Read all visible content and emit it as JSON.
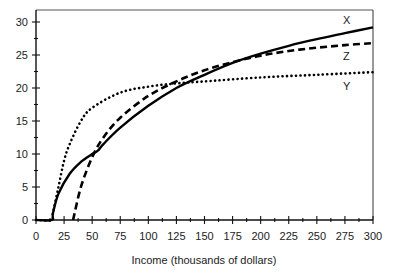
{
  "chart_data": {
    "type": "line",
    "title": "",
    "xlabel": "Income (thousands of dollars)",
    "ylabel": "",
    "xlim": [
      0,
      300
    ],
    "ylim": [
      0,
      30
    ],
    "x_ticks": [
      0,
      25,
      50,
      75,
      100,
      125,
      150,
      175,
      200,
      225,
      250,
      275,
      300
    ],
    "y_ticks": [
      0,
      5,
      10,
      15,
      20,
      25,
      30
    ],
    "grid": false,
    "legend": "inline labels at right end of each curve",
    "series": [
      {
        "name": "X",
        "style": "solid",
        "x": [
          0,
          14,
          15,
          20,
          30,
          40,
          50,
          55,
          60,
          75,
          100,
          125,
          150,
          175,
          200,
          225,
          250,
          275,
          300
        ],
        "y": [
          0,
          0,
          1,
          4,
          7,
          8.8,
          10,
          10.5,
          11.5,
          14,
          17.3,
          20,
          22,
          23.8,
          25.2,
          26.4,
          27.4,
          28.3,
          29.2
        ]
      },
      {
        "name": "Y",
        "style": "dotted",
        "x": [
          0,
          14,
          15,
          20,
          25,
          30,
          40,
          50,
          75,
          100,
          125,
          150,
          200,
          250,
          300
        ],
        "y": [
          0,
          0,
          1,
          5,
          9,
          11.5,
          15,
          17,
          19.3,
          20.2,
          20.7,
          21,
          21.6,
          22,
          22.4
        ]
      },
      {
        "name": "Z",
        "style": "dashed",
        "x": [
          33,
          40,
          50,
          60,
          75,
          100,
          125,
          150,
          175,
          200,
          225,
          250,
          275,
          300
        ],
        "y": [
          0,
          5,
          9.5,
          12.5,
          15.5,
          18.8,
          21,
          22.7,
          23.9,
          24.9,
          25.6,
          26.1,
          26.5,
          26.8
        ]
      }
    ]
  },
  "labels": {
    "x_axis_title": "Income (thousands of dollars)",
    "series_x": "X",
    "series_y": "Y",
    "series_z": "Z"
  }
}
